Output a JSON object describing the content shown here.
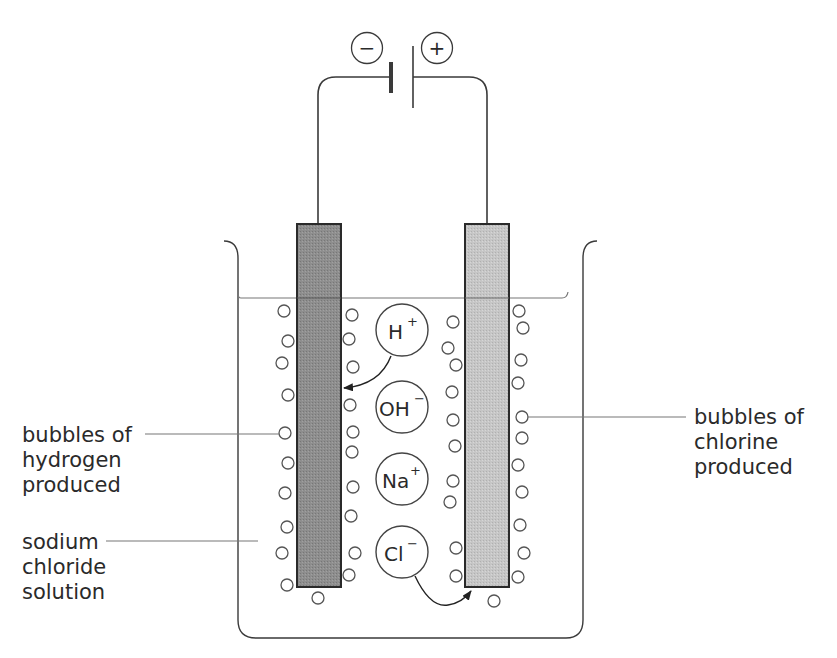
{
  "diagram": {
    "title_partial": "",
    "battery": {
      "negative_symbol": "−",
      "positive_symbol": "+"
    },
    "ions": [
      {
        "base": "H",
        "charge": "+"
      },
      {
        "base": "OH",
        "charge": "−"
      },
      {
        "base": "Na",
        "charge": "+"
      },
      {
        "base": "Cl",
        "charge": "−"
      }
    ],
    "labels": {
      "hydrogen": [
        "bubbles of",
        "hydrogen",
        "produced"
      ],
      "chlorine": [
        "bubbles of",
        "chlorine",
        "produced"
      ],
      "solution": [
        "sodium",
        "chloride",
        "solution"
      ]
    },
    "colors": {
      "line": "#3a3a3a",
      "cathode_fill": "#8c8c8c",
      "anode_fill": "#c4c4c4",
      "bubble_stroke": "#555555",
      "liquid_line": "#777777"
    }
  }
}
